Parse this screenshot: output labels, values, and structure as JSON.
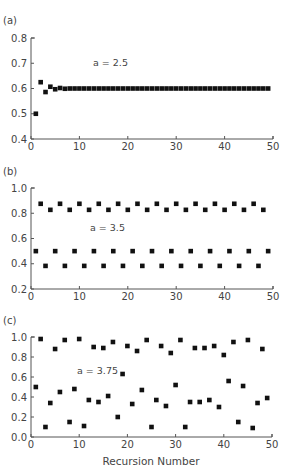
{
  "figure": {
    "xlabel": "Recursion Number"
  },
  "chart_data": [
    {
      "type": "scatter",
      "panel_label": "(a)",
      "annotation": "a = 2.5",
      "xlabel": "",
      "ylabel": "",
      "xlim": [
        0,
        50
      ],
      "ylim": [
        0.4,
        0.8
      ],
      "xticks": [
        "0",
        "10",
        "20",
        "30",
        "40",
        "50"
      ],
      "yticks": [
        "0.4",
        "0.5",
        "0.6",
        "0.7",
        "0.8"
      ],
      "grid": false,
      "x": [
        1,
        2,
        3,
        4,
        5,
        6,
        7,
        8,
        9,
        10,
        11,
        12,
        13,
        14,
        15,
        16,
        17,
        18,
        19,
        20,
        21,
        22,
        23,
        24,
        25,
        26,
        27,
        28,
        29,
        30,
        31,
        32,
        33,
        34,
        35,
        36,
        37,
        38,
        39,
        40,
        41,
        42,
        43,
        44,
        45,
        46,
        47,
        48,
        49
      ],
      "values": [
        0.5,
        0.625,
        0.586,
        0.607,
        0.597,
        0.602,
        0.599,
        0.6,
        0.6,
        0.6,
        0.6,
        0.6,
        0.6,
        0.6,
        0.6,
        0.6,
        0.6,
        0.6,
        0.6,
        0.6,
        0.6,
        0.6,
        0.6,
        0.6,
        0.6,
        0.6,
        0.6,
        0.6,
        0.6,
        0.6,
        0.6,
        0.6,
        0.6,
        0.6,
        0.6,
        0.6,
        0.6,
        0.6,
        0.6,
        0.6,
        0.6,
        0.6,
        0.6,
        0.6,
        0.6,
        0.6,
        0.6,
        0.6,
        0.6
      ]
    },
    {
      "type": "scatter",
      "panel_label": "(b)",
      "annotation": "a = 3.5",
      "xlabel": "",
      "ylabel": "",
      "xlim": [
        0,
        50
      ],
      "ylim": [
        0.2,
        1.0
      ],
      "xticks": [
        "0",
        "10",
        "20",
        "30",
        "40",
        "50"
      ],
      "yticks": [
        "0.2",
        "0.4",
        "0.6",
        "0.8",
        "1.0"
      ],
      "grid": false,
      "x": [
        1,
        2,
        3,
        4,
        5,
        6,
        7,
        8,
        9,
        10,
        11,
        12,
        13,
        14,
        15,
        16,
        17,
        18,
        19,
        20,
        21,
        22,
        23,
        24,
        25,
        26,
        27,
        28,
        29,
        30,
        31,
        32,
        33,
        34,
        35,
        36,
        37,
        38,
        39,
        40,
        41,
        42,
        43,
        44,
        45,
        46,
        47,
        48,
        49
      ],
      "values": [
        0.5,
        0.875,
        0.383,
        0.827,
        0.5,
        0.875,
        0.383,
        0.827,
        0.5,
        0.875,
        0.383,
        0.827,
        0.5,
        0.875,
        0.383,
        0.827,
        0.5,
        0.875,
        0.383,
        0.827,
        0.5,
        0.875,
        0.383,
        0.827,
        0.5,
        0.875,
        0.383,
        0.827,
        0.5,
        0.875,
        0.383,
        0.827,
        0.5,
        0.875,
        0.383,
        0.827,
        0.5,
        0.875,
        0.383,
        0.827,
        0.5,
        0.875,
        0.383,
        0.827,
        0.5,
        0.875,
        0.383,
        0.827,
        0.5
      ]
    },
    {
      "type": "scatter",
      "panel_label": "(c)",
      "annotation": "a = 3.75",
      "xlabel": "Recursion Number",
      "ylabel": "",
      "xlim": [
        0,
        50
      ],
      "ylim": [
        0.0,
        1.0
      ],
      "xticks": [
        "0",
        "10",
        "20",
        "30",
        "40",
        "50"
      ],
      "yticks": [
        "0.0",
        "0.2",
        "0.4",
        "0.6",
        "0.8",
        "1.0"
      ],
      "grid": false,
      "x": [
        1,
        2,
        3,
        4,
        5,
        6,
        7,
        8,
        9,
        10,
        11,
        12,
        13,
        14,
        15,
        16,
        17,
        18,
        19,
        20,
        21,
        22,
        23,
        24,
        25,
        26,
        27,
        28,
        29,
        30,
        31,
        32,
        33,
        34,
        35,
        36,
        37,
        38,
        39,
        40,
        41,
        42,
        43,
        44,
        45,
        46,
        47,
        48,
        49
      ],
      "values": [
        0.5,
        0.98,
        0.1,
        0.34,
        0.88,
        0.45,
        0.97,
        0.15,
        0.48,
        0.98,
        0.11,
        0.37,
        0.9,
        0.35,
        0.89,
        0.41,
        0.95,
        0.2,
        0.63,
        0.91,
        0.33,
        0.86,
        0.47,
        0.97,
        0.1,
        0.37,
        0.91,
        0.31,
        0.84,
        0.52,
        0.97,
        0.1,
        0.35,
        0.89,
        0.35,
        0.89,
        0.37,
        0.91,
        0.3,
        0.82,
        0.56,
        0.95,
        0.15,
        0.51,
        0.97,
        0.09,
        0.34,
        0.88,
        0.39
      ]
    }
  ]
}
